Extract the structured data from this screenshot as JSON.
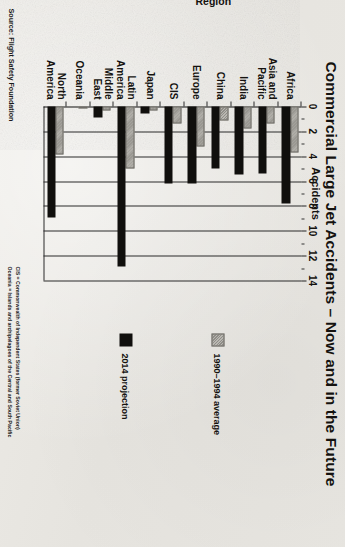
{
  "title": "Commercial Large Jet Accidents – Now and in the Future",
  "source": "Source: Flight Safety Foundation",
  "footnotes": [
    "CIS = Commonwealth of Independent States (former Soviet Union)",
    "Oceania = Islands and archipelagoes of the Central and South Pacific"
  ],
  "legend": [
    {
      "label": "1990–1994 average",
      "color": "#a5a39d",
      "key": "avg"
    },
    {
      "label": "2014 projection",
      "color": "#100f0d",
      "key": "proj"
    }
  ],
  "chart_data": {
    "type": "bar",
    "orientation": "horizontal",
    "title": "Commercial Large Jet Accidents – Now and in the Future",
    "xlabel": "Accidents",
    "ylabel": "Region",
    "xlim": [
      0,
      14
    ],
    "xticks": [
      0,
      2,
      4,
      6,
      8,
      10,
      12,
      14
    ],
    "xtick_labels": [
      "0",
      "2",
      "4",
      "6",
      "8",
      "10",
      "12",
      "14"
    ],
    "minor_tick_step": 1,
    "grid": "vertical-major",
    "legend_position": "right",
    "categories": [
      "Africa",
      "Asia and Pacific",
      "India",
      "China",
      "Europe",
      "CIS",
      "Japan",
      "Latin America",
      "Middle East",
      "Oceania",
      "North America"
    ],
    "series": [
      {
        "name": "1990–1994 average",
        "color": "#a5a39d",
        "values": [
          3.7,
          1.4,
          1.8,
          1.1,
          3.2,
          1.4,
          0.3,
          5.0,
          0.3,
          0.0,
          3.9
        ]
      },
      {
        "name": "2014 projection",
        "color": "#100f0d",
        "values": [
          7.8,
          5.4,
          5.5,
          5.0,
          6.2,
          6.2,
          0.6,
          12.9,
          0.9,
          0.0,
          8.9
        ]
      }
    ]
  }
}
